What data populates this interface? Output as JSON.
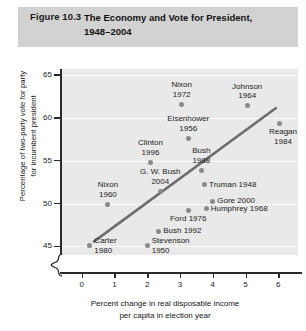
{
  "header": {
    "figure_number": "Figure 10.3",
    "band_color": "#d2d2d2"
  },
  "chart_data": {
    "type": "scatter",
    "xlabel": "Percent change in real disposable income\nper capita in election year",
    "ylabel": "Percentage of two-party vote for party\nfor incumbent president",
    "xlim": [
      -0.6,
      6.6
    ],
    "ylim": [
      44.0,
      65.7
    ],
    "xticks": [
      0,
      1,
      2,
      3,
      4,
      5,
      6
    ],
    "yticks": [
      45,
      50,
      55,
      60,
      65
    ],
    "grid": "horizontal",
    "axis_break": true,
    "legend": "none",
    "plot_background": "#e9e9e9",
    "point_color": "#8a8a8a",
    "line_color": "#6d6d6d",
    "trendline": {
      "x0": 0.35,
      "y0": 45.5,
      "x1": 5.95,
      "y1": 61.2
    },
    "points": [
      {
        "label": "Nixon\n1972",
        "x": 3.05,
        "y": 61.6,
        "label_pos": "above-center"
      },
      {
        "label": "Johnson\n1964",
        "x": 5.05,
        "y": 61.4,
        "label_pos": "above-center"
      },
      {
        "label": "Eisenhower\n1956",
        "x": 3.25,
        "y": 57.6,
        "label_pos": "above-center"
      },
      {
        "label": "Reagan\n1984",
        "x": 6.05,
        "y": 59.4,
        "label_pos": "below-right"
      },
      {
        "label": "Clinton\n1996",
        "x": 2.1,
        "y": 54.8,
        "label_pos": "above-center"
      },
      {
        "label": "Bush\n1988",
        "x": 3.65,
        "y": 53.9,
        "label_pos": "above-center"
      },
      {
        "label": "G. W. Bush\n2004",
        "x": 2.4,
        "y": 51.4,
        "label_pos": "above-center"
      },
      {
        "label": "Nixon\n1960",
        "x": 0.8,
        "y": 49.9,
        "label_pos": "above-center"
      },
      {
        "label": "Truman 1948",
        "x": 3.75,
        "y": 52.2,
        "label_pos": "right"
      },
      {
        "label": "Gore 2000",
        "x": 4.0,
        "y": 50.3,
        "label_pos": "right"
      },
      {
        "label": "Humphrey 1968",
        "x": 3.8,
        "y": 49.4,
        "label_pos": "right"
      },
      {
        "label": "Ford 1976",
        "x": 3.25,
        "y": 49.2,
        "label_pos": "below-center"
      },
      {
        "label": "Bush 1992",
        "x": 2.35,
        "y": 46.8,
        "label_pos": "right"
      },
      {
        "label": "Carter\n1980",
        "x": 0.25,
        "y": 45.1,
        "label_pos": "right"
      },
      {
        "label": "Stevenson\n1950",
        "x": 2.0,
        "y": 45.1,
        "label_pos": "right"
      }
    ]
  }
}
